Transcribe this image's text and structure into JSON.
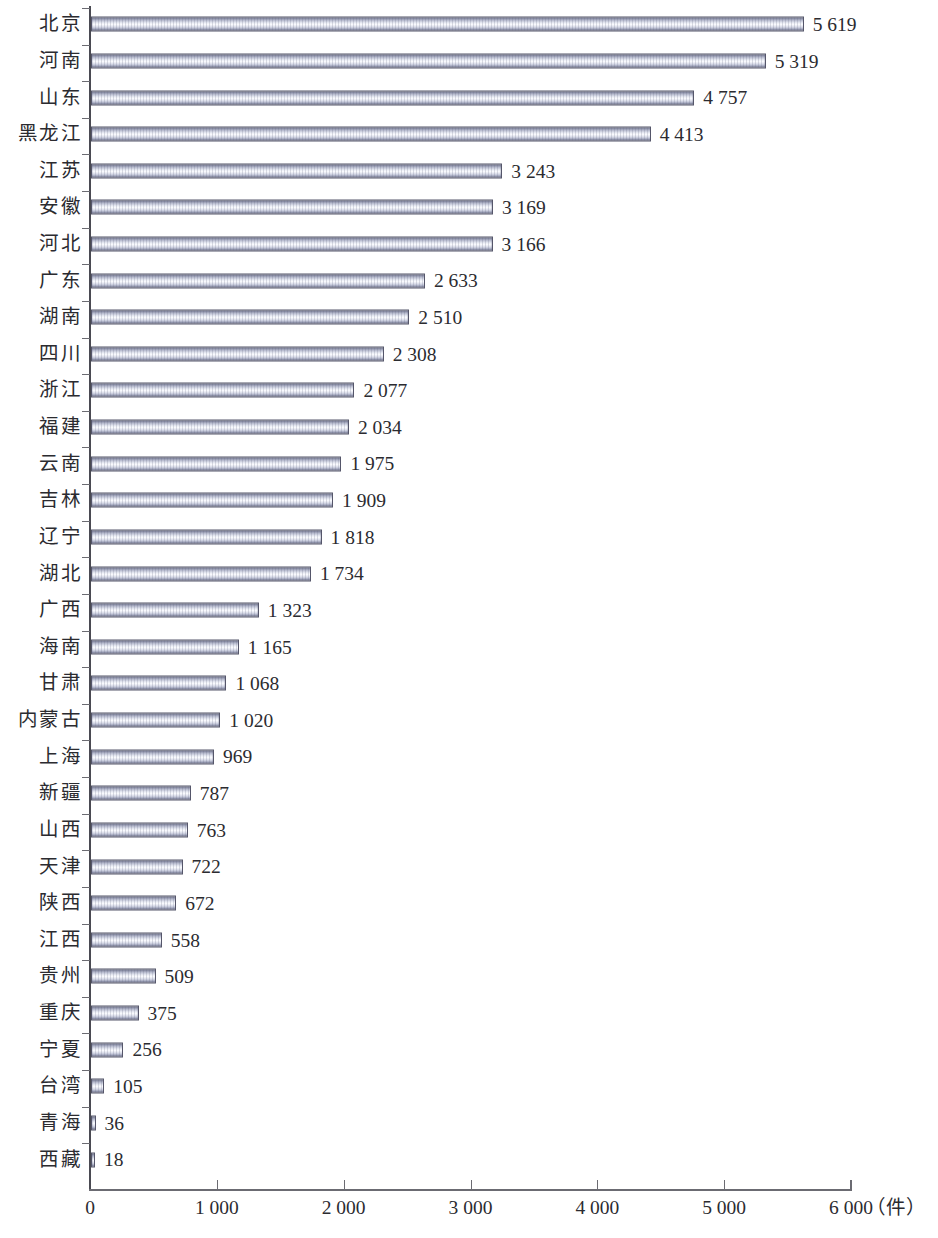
{
  "chart_data": {
    "type": "bar",
    "orientation": "horizontal",
    "title": "",
    "subtitle": "",
    "xlabel": "",
    "ylabel": "",
    "unit_label": "（件）",
    "xlim": [
      0,
      6000
    ],
    "xticks": [
      0,
      1000,
      2000,
      3000,
      4000,
      5000,
      6000
    ],
    "xtick_labels": [
      "0",
      "1 000",
      "2 000",
      "3 000",
      "4 000",
      "5 000",
      "6 000"
    ],
    "grid": false,
    "legend": null,
    "value_label_format": "space-separated thousands",
    "categories": [
      "北京",
      "河南",
      "山东",
      "黑龙江",
      "江苏",
      "安徽",
      "河北",
      "广东",
      "湖南",
      "四川",
      "浙江",
      "福建",
      "云南",
      "吉林",
      "辽宁",
      "湖北",
      "广西",
      "海南",
      "甘肃",
      "内蒙古",
      "上海",
      "新疆",
      "山西",
      "天津",
      "陕西",
      "江西",
      "贵州",
      "重庆",
      "宁夏",
      "台湾",
      "青海",
      "西藏"
    ],
    "values": [
      5619,
      5319,
      4757,
      4413,
      3243,
      3169,
      3166,
      2633,
      2510,
      2308,
      2077,
      2034,
      1975,
      1909,
      1818,
      1734,
      1323,
      1165,
      1068,
      1020,
      969,
      787,
      763,
      722,
      672,
      558,
      509,
      375,
      256,
      105,
      36,
      18
    ],
    "value_labels": [
      "5 619",
      "5 319",
      "4 757",
      "4 413",
      "3 243",
      "3 169",
      "3 166",
      "2 633",
      "2 510",
      "2 308",
      "2 077",
      "2 034",
      "1 975",
      "1 909",
      "1 818",
      "1 734",
      "1 323",
      "1 165",
      "1 068",
      "1 020",
      "969",
      "787",
      "763",
      "722",
      "672",
      "558",
      "509",
      "375",
      "256",
      "105",
      "36",
      "18"
    ],
    "colors": {
      "bar_edge": "#55566a",
      "bar_highlight": "#fbfcff",
      "bar_shadow": "#63667c",
      "axis": "#6b6b72",
      "text": "#2b2b30",
      "background": "#ffffff"
    }
  }
}
